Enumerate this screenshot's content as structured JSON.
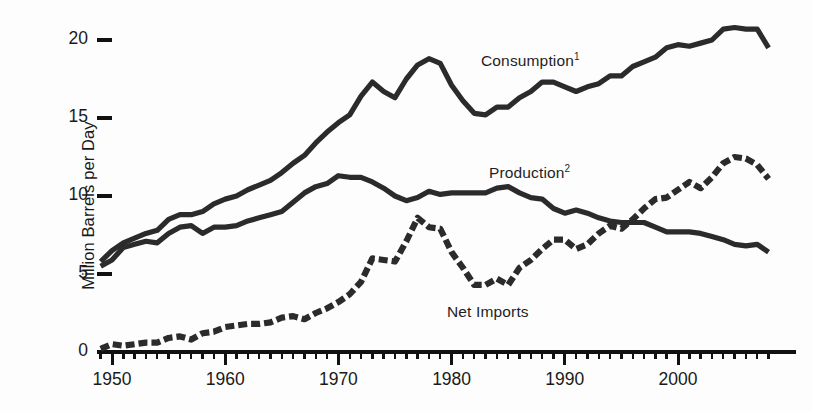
{
  "figure": {
    "background_color": "#fdfdfd",
    "ink_color": "#2b2b2b",
    "axis_color": "#111111"
  },
  "axes": {
    "y_axis_title": "Million Barrels per Day",
    "y_ticks": [
      "0",
      "5",
      "10",
      "15",
      "20"
    ],
    "x_ticks": [
      "1950",
      "1960",
      "1970",
      "1980",
      "1990",
      "2000"
    ]
  },
  "labels": {
    "consumption": {
      "text": "Consumption",
      "superscript": "1"
    },
    "production": {
      "text": "Production",
      "superscript": "2"
    },
    "net_imports": {
      "text": "Net Imports",
      "superscript": ""
    }
  },
  "chart_data": {
    "type": "line",
    "title": "",
    "xlabel": "",
    "ylabel": "Million Barrels per Day",
    "xlim": [
      1948.5,
      2008.5
    ],
    "ylim": [
      0,
      21.5
    ],
    "yticks": [
      0,
      5,
      10,
      15,
      20
    ],
    "xticks": [
      1950,
      1960,
      1970,
      1980,
      1990,
      2000
    ],
    "minor_xtick_interval": 1,
    "grid": false,
    "legend": "inline-annotations",
    "x": [
      1949,
      1950,
      1951,
      1952,
      1953,
      1954,
      1955,
      1956,
      1957,
      1958,
      1959,
      1960,
      1961,
      1962,
      1963,
      1964,
      1965,
      1966,
      1967,
      1968,
      1969,
      1970,
      1971,
      1972,
      1973,
      1974,
      1975,
      1976,
      1977,
      1978,
      1979,
      1980,
      1981,
      1982,
      1983,
      1984,
      1985,
      1986,
      1987,
      1988,
      1989,
      1990,
      1991,
      1992,
      1993,
      1994,
      1995,
      1996,
      1997,
      1998,
      1999,
      2000,
      2001,
      2002,
      2003,
      2004,
      2005,
      2006,
      2007,
      2008
    ],
    "series": [
      {
        "name": "Consumption",
        "style": "solid",
        "values": [
          5.8,
          6.5,
          7.0,
          7.3,
          7.6,
          7.8,
          8.5,
          8.8,
          8.8,
          9.0,
          9.5,
          9.8,
          10.0,
          10.4,
          10.7,
          11.0,
          11.5,
          12.1,
          12.6,
          13.4,
          14.1,
          14.7,
          15.2,
          16.4,
          17.3,
          16.7,
          16.3,
          17.5,
          18.4,
          18.8,
          18.5,
          17.1,
          16.1,
          15.3,
          15.2,
          15.7,
          15.7,
          16.3,
          16.7,
          17.3,
          17.3,
          17.0,
          16.7,
          17.0,
          17.2,
          17.7,
          17.7,
          18.3,
          18.6,
          18.9,
          19.5,
          19.7,
          19.6,
          19.8,
          20.0,
          20.7,
          20.8,
          20.7,
          20.7,
          19.5
        ]
      },
      {
        "name": "Production",
        "style": "solid",
        "values": [
          5.5,
          5.9,
          6.7,
          6.9,
          7.1,
          7.0,
          7.6,
          8.0,
          8.1,
          7.6,
          8.0,
          8.0,
          8.1,
          8.4,
          8.6,
          8.8,
          9.0,
          9.6,
          10.2,
          10.6,
          10.8,
          11.3,
          11.2,
          11.2,
          10.9,
          10.5,
          10.0,
          9.7,
          9.9,
          10.3,
          10.1,
          10.2,
          10.2,
          10.2,
          10.2,
          10.5,
          10.6,
          10.2,
          9.9,
          9.8,
          9.2,
          8.9,
          9.1,
          8.9,
          8.6,
          8.4,
          8.3,
          8.3,
          8.3,
          8.0,
          7.7,
          7.7,
          7.7,
          7.6,
          7.4,
          7.2,
          6.9,
          6.8,
          6.9,
          6.4
        ]
      },
      {
        "name": "Net Imports",
        "style": "dashed",
        "values": [
          0.2,
          0.5,
          0.4,
          0.5,
          0.6,
          0.6,
          0.9,
          1.0,
          0.8,
          1.2,
          1.3,
          1.6,
          1.7,
          1.8,
          1.8,
          1.9,
          2.2,
          2.3,
          2.1,
          2.5,
          2.8,
          3.2,
          3.7,
          4.5,
          6.0,
          5.9,
          5.8,
          7.1,
          8.6,
          8.0,
          7.9,
          6.4,
          5.4,
          4.3,
          4.3,
          4.7,
          4.3,
          5.4,
          5.9,
          6.6,
          7.2,
          7.2,
          6.6,
          6.9,
          7.6,
          8.1,
          7.9,
          8.5,
          9.2,
          9.8,
          9.9,
          10.4,
          10.9,
          10.5,
          11.2,
          12.1,
          12.5,
          12.4,
          12.0,
          11.1
        ]
      }
    ]
  }
}
